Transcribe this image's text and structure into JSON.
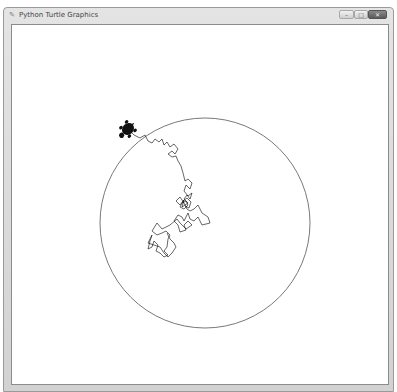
{
  "window": {
    "title": "Python Turtle Graphics",
    "title_icon": "tk-feather-icon",
    "controls": {
      "minimize": "–",
      "maximize": "□",
      "close": "✕"
    }
  },
  "canvas": {
    "background": "#ffffff",
    "pen_color": "#000000",
    "circle": {
      "cx": 193,
      "cy": 198,
      "r": 105,
      "stroke": "#555555"
    },
    "turtle": {
      "x": 116,
      "y": 104,
      "heading_deg": 135,
      "fill": "#111111"
    }
  }
}
